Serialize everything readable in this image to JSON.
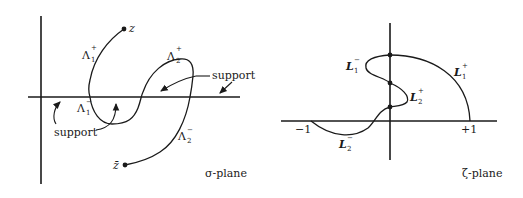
{
  "left_panel": {
    "plane_label": "σ-plane",
    "point_top": "z",
    "point_bottom": "z̄",
    "curves": [
      {
        "name": "Lambda1-plus",
        "base": "Λ",
        "sub": "1",
        "sup": "+"
      },
      {
        "name": "Lambda1-minus",
        "base": "Λ",
        "sub": "1",
        "sup": "−"
      },
      {
        "name": "Lambda2-plus",
        "base": "Λ",
        "sub": "2",
        "sup": "+"
      },
      {
        "name": "Lambda2-minus",
        "base": "Λ",
        "sub": "2",
        "sup": "−"
      }
    ],
    "support_labels": [
      "support",
      "support"
    ]
  },
  "right_panel": {
    "plane_label": "ζ-plane",
    "tick_minus_one": "−1",
    "tick_plus_one": "+1",
    "curves": [
      {
        "name": "L1-minus",
        "base": "L",
        "sub": "1",
        "sup": "−"
      },
      {
        "name": "L1-plus",
        "base": "L",
        "sub": "1",
        "sup": "+"
      },
      {
        "name": "L2-plus",
        "base": "L",
        "sub": "2",
        "sup": "+"
      },
      {
        "name": "L2-minus",
        "base": "L",
        "sub": "2",
        "sup": "−"
      }
    ]
  }
}
